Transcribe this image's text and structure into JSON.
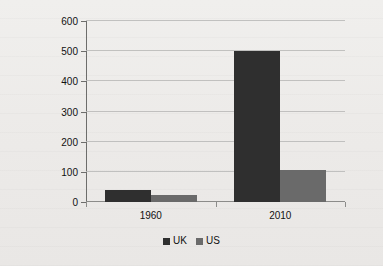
{
  "chart_data": {
    "type": "bar",
    "title": "",
    "xlabel": "",
    "ylabel": "% share of GDP",
    "categories": [
      "1960",
      "2010"
    ],
    "series": [
      {
        "name": "UK",
        "color": "#2f2f2f",
        "values": [
          40,
          500
        ]
      },
      {
        "name": "US",
        "color": "#6a6a6a",
        "values": [
          22,
          105
        ]
      }
    ],
    "ylim": [
      0,
      600
    ],
    "yticks": [
      0,
      100,
      200,
      300,
      400,
      500,
      600
    ],
    "ytick_labels": [
      "0",
      "100",
      "200",
      "300",
      "400",
      "500",
      "600"
    ],
    "grid": true,
    "legend_position": "bottom"
  }
}
